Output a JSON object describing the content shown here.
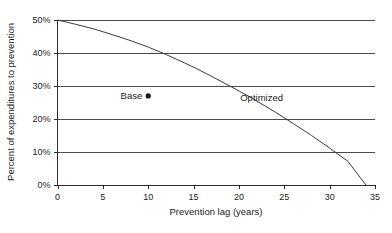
{
  "chart_data": {
    "type": "line",
    "title": "",
    "xlabel": "Prevention lag (years)",
    "ylabel": "Percent of expenditures to prevention",
    "xlim": [
      0,
      35
    ],
    "ylim": [
      0,
      50
    ],
    "grid": "horizontal",
    "legend": "inline-annotations",
    "xticks": [
      "0",
      "5",
      "10",
      "15",
      "20",
      "25",
      "30",
      "35"
    ],
    "xtick_values": [
      0,
      5,
      10,
      15,
      20,
      25,
      30,
      35
    ],
    "yticks": [
      "0%",
      "10%",
      "20%",
      "30%",
      "40%",
      "50%"
    ],
    "ytick_values": [
      0,
      10,
      20,
      30,
      40,
      50
    ],
    "series": [
      {
        "name": "Optimized",
        "type": "line",
        "label": "Optimized",
        "label_x": 22.5,
        "label_y": 25.5,
        "color": "#3a3a3a",
        "x": [
          0,
          2,
          4,
          6,
          8,
          10,
          12,
          14,
          15.3,
          17,
          19,
          21,
          22,
          24,
          26,
          28,
          30,
          32,
          34
        ],
        "y": [
          50,
          48.7,
          47.3,
          45.6,
          43.8,
          41.8,
          39.5,
          37.0,
          35.3,
          32.9,
          30.0,
          27.0,
          25.4,
          22.1,
          18.6,
          15.0,
          11.2,
          7.2,
          0.0
        ]
      },
      {
        "name": "Base",
        "type": "scatter",
        "label": "Base",
        "color": "#1a1a1a",
        "points": [
          {
            "x": 10,
            "y": 27
          }
        ]
      }
    ]
  }
}
